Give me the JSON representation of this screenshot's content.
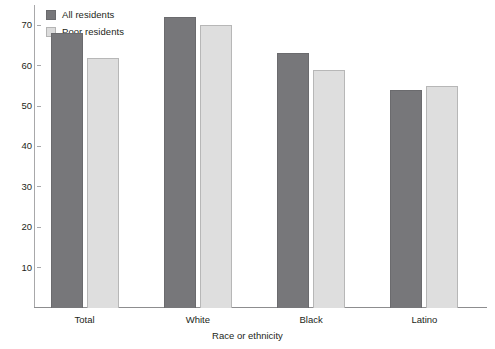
{
  "chart_data": {
    "type": "bar",
    "title": "",
    "xlabel": "Race or ethnicity",
    "ylabel": "",
    "categories": [
      "Total",
      "White",
      "Black",
      "Latino"
    ],
    "series": [
      {
        "name": "All residents",
        "color": "#77777a",
        "values": [
          68,
          72,
          63,
          54
        ]
      },
      {
        "name": "Poor residents",
        "color": "#dedede",
        "values": [
          62,
          70,
          59,
          55
        ]
      }
    ],
    "ylim": [
      0,
      75
    ],
    "yticks": [
      10,
      20,
      30,
      40,
      50,
      60,
      70
    ],
    "ytick_labels": [
      "10",
      "20",
      "30",
      "40",
      "50",
      "60",
      "70"
    ],
    "grid": false,
    "legend_position": "top-left"
  },
  "legend": {
    "items": [
      {
        "label": "All residents",
        "swatch": "dark-swatch-icon"
      },
      {
        "label": "Poor residents",
        "swatch": "light-swatch-icon"
      }
    ]
  }
}
